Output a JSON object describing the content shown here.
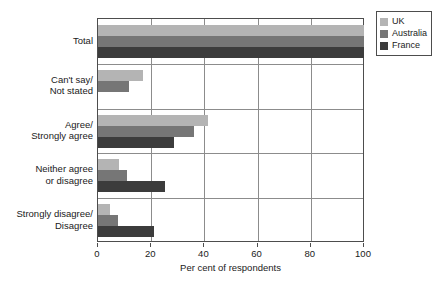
{
  "chart_data": {
    "type": "bar",
    "orientation": "horizontal",
    "title": "",
    "xlabel": "Per cent of respondents",
    "ylabel": "",
    "xlim": [
      0,
      100
    ],
    "xticks": [
      0,
      20,
      40,
      60,
      80,
      100
    ],
    "grid": true,
    "legend_position": "top-right",
    "categories": [
      "Total",
      "Can't say/\nNot stated",
      "Agree/\nStrongly agree",
      "Neither agree\nor disagree",
      "Strongly disagree/\nDisagree"
    ],
    "category_lines": [
      [
        "Total"
      ],
      [
        "Can't say/",
        "Not stated"
      ],
      [
        "Agree/",
        "Strongly agree"
      ],
      [
        "Neither agree",
        "or disagree"
      ],
      [
        "Strongly disagree/",
        "Disagree"
      ]
    ],
    "series": [
      {
        "name": "UK",
        "color": "#b4b4b4",
        "values": [
          100,
          17,
          41.5,
          8,
          4.5
        ]
      },
      {
        "name": "Australia",
        "color": "#767676",
        "values": [
          100,
          11.5,
          36,
          11,
          7.5
        ]
      },
      {
        "name": "France",
        "color": "#3c3c3c",
        "values": [
          100,
          0,
          28.5,
          25,
          21
        ]
      }
    ]
  },
  "legend": {
    "items": [
      {
        "label": "UK",
        "swatch": "uk"
      },
      {
        "label": "Australia",
        "swatch": "australia"
      },
      {
        "label": "France",
        "swatch": "france"
      }
    ]
  },
  "axis": {
    "x_title": "Per cent of respondents",
    "x_tick_labels": [
      "0",
      "20",
      "40",
      "60",
      "80",
      "100"
    ]
  }
}
